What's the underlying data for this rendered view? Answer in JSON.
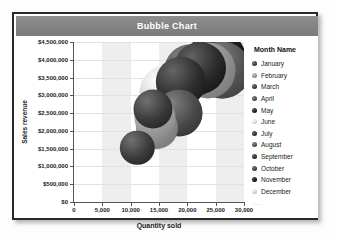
{
  "window": {
    "title": "Bubble Chart"
  },
  "legend": {
    "title": "Month Name",
    "more_indicator": "...",
    "items": [
      {
        "label": "January",
        "color": "#3b3b3b"
      },
      {
        "label": "February",
        "color": "#8c8c8c"
      },
      {
        "label": "March",
        "color": "#3a3a3a"
      },
      {
        "label": "April",
        "color": "#4a4a4a"
      },
      {
        "label": "May",
        "color": "#1f1f1f"
      },
      {
        "label": "June",
        "color": "#d2d2d2"
      },
      {
        "label": "July",
        "color": "#2e2e2e"
      },
      {
        "label": "August",
        "color": "#4f4f4f"
      },
      {
        "label": "September",
        "color": "#2b2b2b"
      },
      {
        "label": "October",
        "color": "#3f3f3f"
      },
      {
        "label": "November",
        "color": "#151515"
      },
      {
        "label": "December",
        "color": "#c9c9c9"
      }
    ]
  },
  "chart_data": {
    "type": "scatter",
    "title": "Bubble Chart",
    "xlabel": "Quantity sold",
    "ylabel": "Sales revenue",
    "xlim": [
      0,
      30000
    ],
    "ylim": [
      0,
      4500000
    ],
    "xticks": [
      0,
      5000,
      10000,
      15000,
      20000,
      25000,
      30000
    ],
    "xticklabels": [
      "0",
      "5,000",
      "10,000",
      "15,000",
      "20,000",
      "25,000",
      "30,000"
    ],
    "yticks": [
      0,
      500000,
      1000000,
      1500000,
      2000000,
      2500000,
      3000000,
      3500000,
      4000000,
      4500000
    ],
    "yticklabels": [
      "$0",
      "$500,000",
      "$1,000,000",
      "$1,500,000",
      "$2,000,000",
      "$2,500,000",
      "$3,000,000",
      "$3,500,000",
      "$4,000,000",
      "$4,500,000"
    ],
    "grid": true,
    "legend_position": "right",
    "series_field": "Month Name",
    "points": [
      {
        "name": "January",
        "x": 11200,
        "y": 1520000,
        "size": 1400,
        "color": "#3b3b3b"
      },
      {
        "name": "February",
        "x": 14600,
        "y": 2080000,
        "size": 2100,
        "color": "#8c8c8c"
      },
      {
        "name": "March",
        "x": 14300,
        "y": 2380000,
        "size": 2000,
        "color": "#9e9e9e"
      },
      {
        "name": "April",
        "x": 13900,
        "y": 2620000,
        "size": 1800,
        "color": "#3a3a3a"
      },
      {
        "name": "May",
        "x": 18600,
        "y": 2510000,
        "size": 2600,
        "color": "#4a4a4a"
      },
      {
        "name": "June",
        "x": 16300,
        "y": 3080000,
        "size": 3300,
        "color": "#d2d2d2"
      },
      {
        "name": "July",
        "x": 18900,
        "y": 3380000,
        "size": 3000,
        "color": "#2e2e2e"
      },
      {
        "name": "August",
        "x": 20600,
        "y": 3680000,
        "size": 3400,
        "color": "#4f4f4f"
      },
      {
        "name": "September",
        "x": 22300,
        "y": 3760000,
        "size": 3200,
        "color": "#2b2b2b"
      },
      {
        "name": "October",
        "x": 23600,
        "y": 3700000,
        "size": 3600,
        "color": "#8f8f8f"
      },
      {
        "name": "November",
        "x": 25200,
        "y": 3980000,
        "size": 4200,
        "color": "#1a1a1a"
      },
      {
        "name": "December",
        "x": 26100,
        "y": 3700000,
        "size": 3800,
        "color": "#555555"
      }
    ],
    "bands": [
      {
        "from": 5000,
        "to": 10000
      },
      {
        "from": 15000,
        "to": 20000
      },
      {
        "from": 25000,
        "to": 30000
      }
    ]
  }
}
